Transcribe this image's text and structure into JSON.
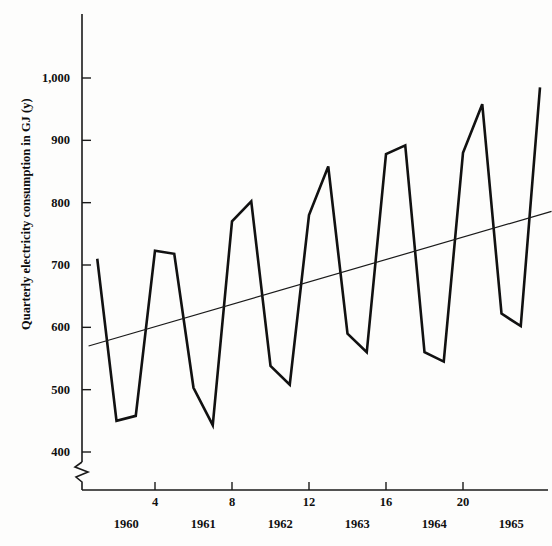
{
  "chart_data": {
    "type": "line",
    "title": "",
    "subtitle": "",
    "xlabel": "",
    "ylabel": "Quarterly electricity consumption in GJ (y)",
    "xlim": [
      0.2,
      24.8
    ],
    "ylim": [
      370,
      1030
    ],
    "grid": false,
    "legend": null,
    "y_ticks": [
      400,
      500,
      600,
      700,
      800,
      900,
      1000
    ],
    "y_tick_labels": [
      "400",
      "500",
      "600",
      "700",
      "800",
      "900",
      "1,000"
    ],
    "x_ticks": [
      4,
      8,
      12,
      16,
      20
    ],
    "x_tick_labels": [
      "4",
      "8",
      "12",
      "16",
      "20"
    ],
    "x_year_labels": [
      {
        "label": "1960",
        "quarter": 2.5
      },
      {
        "label": "1961",
        "quarter": 6.5
      },
      {
        "label": "1962",
        "quarter": 10.5
      },
      {
        "label": "1963",
        "quarter": 14.5
      },
      {
        "label": "1964",
        "quarter": 18.5
      },
      {
        "label": "1965",
        "quarter": 22.5
      }
    ],
    "axis_break": true,
    "x": [
      1,
      2,
      3,
      4,
      5,
      6,
      7,
      8,
      9,
      10,
      11,
      12,
      13,
      14,
      15,
      16,
      17,
      18,
      19,
      20,
      21,
      22,
      23,
      24
    ],
    "series": [
      {
        "name": "Quarterly electricity consumption",
        "values": [
          710,
          450,
          458,
          723,
          718,
          503,
          443,
          770,
          802,
          538,
          508,
          780,
          858,
          590,
          560,
          878,
          892,
          560,
          545,
          880,
          958,
          622,
          602,
          985
        ]
      },
      {
        "name": "Fitted linear trend",
        "type": "trend",
        "values": [
          572,
          581,
          590,
          599,
          608,
          617,
          626,
          635,
          644,
          653,
          662,
          671,
          680,
          689,
          698,
          707,
          716,
          725,
          734,
          743,
          752,
          761,
          770,
          779
        ]
      }
    ],
    "trend_endpoints": {
      "x0": 0.55,
      "y0": 570,
      "x1": 24.6,
      "y1": 786
    }
  },
  "axis": {
    "y_title": "Quarterly electricity consumption in GJ (y)"
  }
}
